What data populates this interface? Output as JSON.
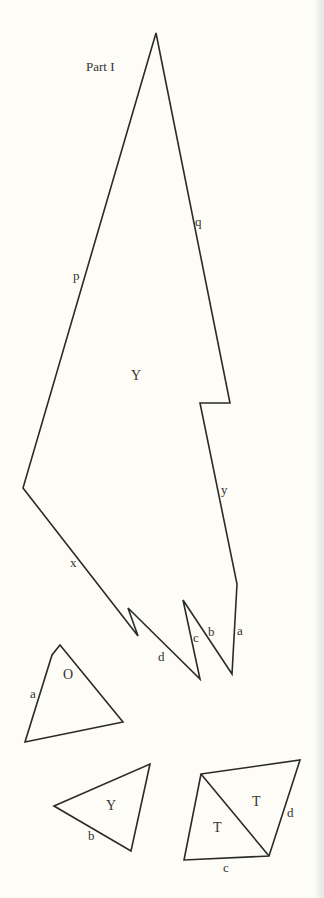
{
  "title": "Part I",
  "pieces": [
    {
      "name": "large-piece-Y",
      "region_label": "Y",
      "edge_labels": [
        "p",
        "q",
        "y",
        "x",
        "a",
        "b",
        "c",
        "d"
      ]
    },
    {
      "name": "triangle-O",
      "region_label": "O",
      "edge_labels": [
        "a"
      ]
    },
    {
      "name": "triangle-Y",
      "region_label": "Y",
      "edge_labels": [
        "b"
      ]
    },
    {
      "name": "quadrilateral-TT",
      "region_labels": [
        "T",
        "T"
      ],
      "edge_labels": [
        "c",
        "d"
      ]
    }
  ],
  "colors": {
    "background": "#fdfcf6",
    "stroke": "#2a2a2a",
    "text": "#333333"
  }
}
